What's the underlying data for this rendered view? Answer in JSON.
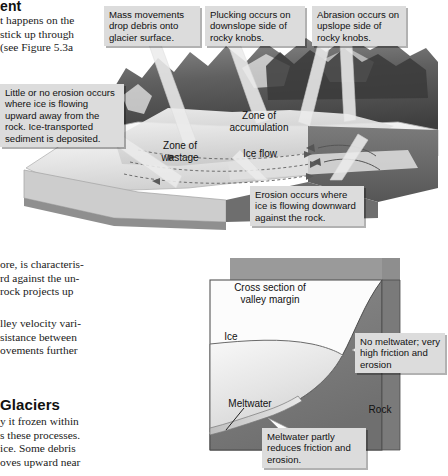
{
  "page": {
    "heading_fragment": "ent",
    "body_lines_top": [
      "t happens on the",
      "stick up through",
      " (see Figure 5.3a"
    ],
    "body_lines_middle": [
      "ore, is characteris-",
      "rd against the un-",
      " rock  projects  up"
    ],
    "body_lines_middle2": [
      "lley velocity vari-",
      "sistance  between",
      "ovements  further"
    ],
    "subheading_fragment": "Glaciers",
    "body_lines_bottom": [
      "y it frozen within",
      "s these processes.",
      " ice. Some  debris",
      "oves upward near"
    ]
  },
  "figure_top": {
    "callouts": [
      {
        "id": "mass-movements",
        "text": "Mass movements drop debris onto glacier surface."
      },
      {
        "id": "plucking",
        "text": "Plucking occurs on downslope side of rocky knobs."
      },
      {
        "id": "abrasion",
        "text": "Abrasion occurs on upslope side of rocky knobs."
      },
      {
        "id": "little-no-erosion",
        "text": "Little or no erosion occurs where ice is flowing upward away from the rock.  Ice-transported sediment is deposited."
      },
      {
        "id": "erosion-occurs",
        "text": "Erosion occurs where ice is flowing downward against the rock."
      }
    ],
    "labels": [
      {
        "id": "zone-of-accumulation",
        "line1": "Zone of",
        "line2": "accumulation"
      },
      {
        "id": "zone-of-wastage",
        "line1": "Zone of",
        "line2": "wastage"
      },
      {
        "id": "ice-flow",
        "line1": "Ice flow",
        "line2": ""
      }
    ]
  },
  "figure_bottom": {
    "title": {
      "line1": "Cross section of",
      "line2": "valley margin"
    },
    "labels": [
      {
        "id": "ice",
        "text": "Ice"
      },
      {
        "id": "meltwater",
        "text": "Meltwater"
      },
      {
        "id": "rock",
        "text": "Rock"
      }
    ],
    "callouts": [
      {
        "id": "no-meltwater",
        "text": "No meltwater; very high friction and erosion"
      },
      {
        "id": "meltwater-partly",
        "text": "Meltwater partly reduces friction and erosion."
      }
    ]
  },
  "colors": {
    "callout_bg": "#dcdcdc",
    "ice_light": "#f2f2f2",
    "ice_mid": "#d9d9d9",
    "rock_dark": "#808080",
    "rock_darker": "#6b6b6b",
    "page_bg": "#ffffff"
  }
}
